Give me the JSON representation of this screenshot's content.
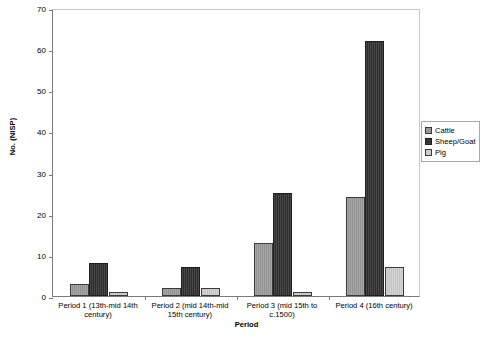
{
  "chart_data": {
    "type": "bar",
    "title": "",
    "xlabel": "Period",
    "ylabel": "No. (NISP)",
    "ylim": [
      0,
      70
    ],
    "ytick_step": 10,
    "yticks": [
      0,
      10,
      20,
      30,
      40,
      50,
      60,
      70
    ],
    "grid": false,
    "legend_position": "right",
    "categories": [
      "Period 1 (13th-mid 14th century)",
      "Period 2 (mid 14th-mid 15th century)",
      "Period 3 (mid 15th to c.1500)",
      "Period 4 (16th century)"
    ],
    "series": [
      {
        "name": "Cattle",
        "color": "#9a9a9a",
        "values": [
          3,
          2,
          13,
          24
        ]
      },
      {
        "name": "Sheep/Goat",
        "color": "#353535",
        "values": [
          8,
          7,
          25,
          62
        ]
      },
      {
        "name": "Pig",
        "color": "#cbcbcb",
        "values": [
          1,
          2,
          1,
          7
        ]
      }
    ]
  },
  "legend": {
    "items": [
      {
        "label": "Cattle"
      },
      {
        "label": "Sheep/Goat"
      },
      {
        "label": "Pig"
      }
    ]
  }
}
